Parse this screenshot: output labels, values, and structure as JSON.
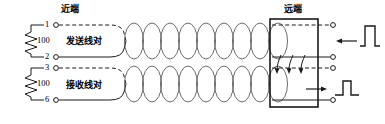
{
  "diagram": {
    "title_near_end": "近端",
    "title_far_end": "远端",
    "pair_transmit_label": "发送线对",
    "pair_receive_label": "接收线对",
    "terminals": {
      "t1": "1",
      "t2": "2",
      "t3": "3",
      "t6": "6"
    },
    "resistors": {
      "transmit_value": "100",
      "receive_value": "100"
    },
    "colors": {
      "line": "#1a1a1a",
      "twist": "#4a4a4a",
      "background": "#ffffff"
    },
    "signals": {
      "incoming_pulse_name": "pulse-large",
      "crosstalk_pulse_name": "pulse-small",
      "arrow_in_direction": "left",
      "arrow_out_direction": "right",
      "coupling_arrow_count": "3"
    }
  }
}
